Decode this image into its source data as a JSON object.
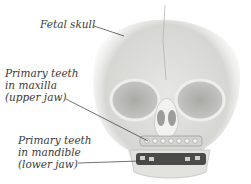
{
  "diagram": {
    "labels": [
      {
        "id": "fetal-skull",
        "lines": [
          "Fetal skull"
        ]
      },
      {
        "id": "maxilla-teeth",
        "lines": [
          "Primary teeth",
          "in maxilla",
          "(upper jaw)"
        ]
      },
      {
        "id": "mandible-teeth",
        "lines": [
          "Primary teeth",
          "in mandible",
          "(lower jaw)"
        ]
      }
    ]
  }
}
